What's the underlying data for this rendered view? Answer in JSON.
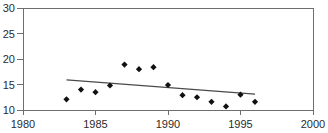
{
  "chart_data": {
    "type": "scatter",
    "title": "",
    "subtitle": "",
    "xlabel": "",
    "ylabel": "",
    "xlim": [
      1980,
      2000
    ],
    "ylim": [
      10,
      30
    ],
    "xticks": [
      1980,
      1985,
      1990,
      1995,
      2000
    ],
    "yticks": [
      10,
      15,
      20,
      25,
      30
    ],
    "xtick_labels": [
      "1980",
      "1985",
      "1990",
      "1995",
      "2000"
    ],
    "ytick_labels": [
      "10",
      "15",
      "20",
      "25",
      "30"
    ],
    "grid": false,
    "legend": "none",
    "x": [
      1983,
      1984,
      1985,
      1986,
      1987,
      1988,
      1989,
      1990,
      1991,
      1992,
      1993,
      1994,
      1995,
      1996
    ],
    "values": [
      12.1,
      14.0,
      13.5,
      14.8,
      18.9,
      18.0,
      18.4,
      14.9,
      12.9,
      12.5,
      11.6,
      10.7,
      13.0,
      11.6
    ],
    "series": [
      {
        "name": "observations",
        "marker": "diamond",
        "color": "#111111",
        "x": [
          1983,
          1984,
          1985,
          1986,
          1987,
          1988,
          1989,
          1990,
          1991,
          1992,
          1993,
          1994,
          1995,
          1996
        ],
        "values": [
          12.1,
          14.0,
          13.5,
          14.8,
          18.9,
          18.0,
          18.4,
          14.9,
          12.9,
          12.5,
          11.6,
          10.7,
          13.0,
          11.6
        ]
      },
      {
        "name": "trend",
        "type": "line",
        "color": "#4a4a4a",
        "x": [
          1983,
          1996
        ],
        "values": [
          15.9,
          13.1
        ]
      }
    ],
    "annotations": []
  },
  "axes": {
    "x_axis_name": "year-axis",
    "y_axis_name": "value-axis"
  }
}
